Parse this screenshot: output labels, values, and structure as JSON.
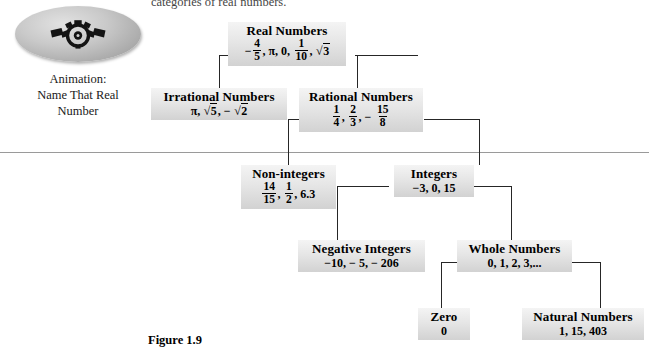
{
  "page": {
    "top_text": "categories of real numbers.",
    "figure_caption": "Figure 1.9"
  },
  "animation": {
    "icon": "eye-gear-icon",
    "caption_line1": "Animation:",
    "caption_line2": "Name That Real",
    "caption_line3": "Number"
  },
  "diagram": {
    "type": "tree",
    "nodes": {
      "real": {
        "title": "Real Numbers",
        "items_text": "-4/5, π, 0, 1/10, √3"
      },
      "irrational": {
        "title": "Irrational Numbers",
        "items_text": "π, √5, −√2"
      },
      "rational": {
        "title": "Rational Numbers",
        "items_text": "1/4, 2/3, − 15/8"
      },
      "nonintegers": {
        "title": "Non-integers",
        "items_text": "14/15, 1/2, 6.3"
      },
      "integers": {
        "title": "Integers",
        "items_text": "−3,  0,  15"
      },
      "negative_integers": {
        "title": "Negative Integers",
        "items_text": "−10, − 5, − 206"
      },
      "whole": {
        "title": "Whole Numbers",
        "items_text": "0, 1, 2, 3,..."
      },
      "zero": {
        "title": "Zero",
        "items_text": "0"
      },
      "natural": {
        "title": "Natural Numbers",
        "items_text": "1, 15, 403"
      }
    },
    "edges": [
      {
        "from": "real",
        "to": "irrational"
      },
      {
        "from": "real",
        "to": "rational"
      },
      {
        "from": "rational",
        "to": "nonintegers"
      },
      {
        "from": "rational",
        "to": "integers"
      },
      {
        "from": "integers",
        "to": "negative_integers"
      },
      {
        "from": "integers",
        "to": "whole"
      },
      {
        "from": "whole",
        "to": "zero"
      },
      {
        "from": "whole",
        "to": "natural"
      }
    ]
  },
  "colors": {
    "node_fill_light": "#f4f4f4",
    "node_fill_dark": "#d2d2d2",
    "line": "#262626",
    "rule": "#9a9a9a"
  },
  "symbols": {
    "pi": "π",
    "radical": "√",
    "minus": "−"
  }
}
